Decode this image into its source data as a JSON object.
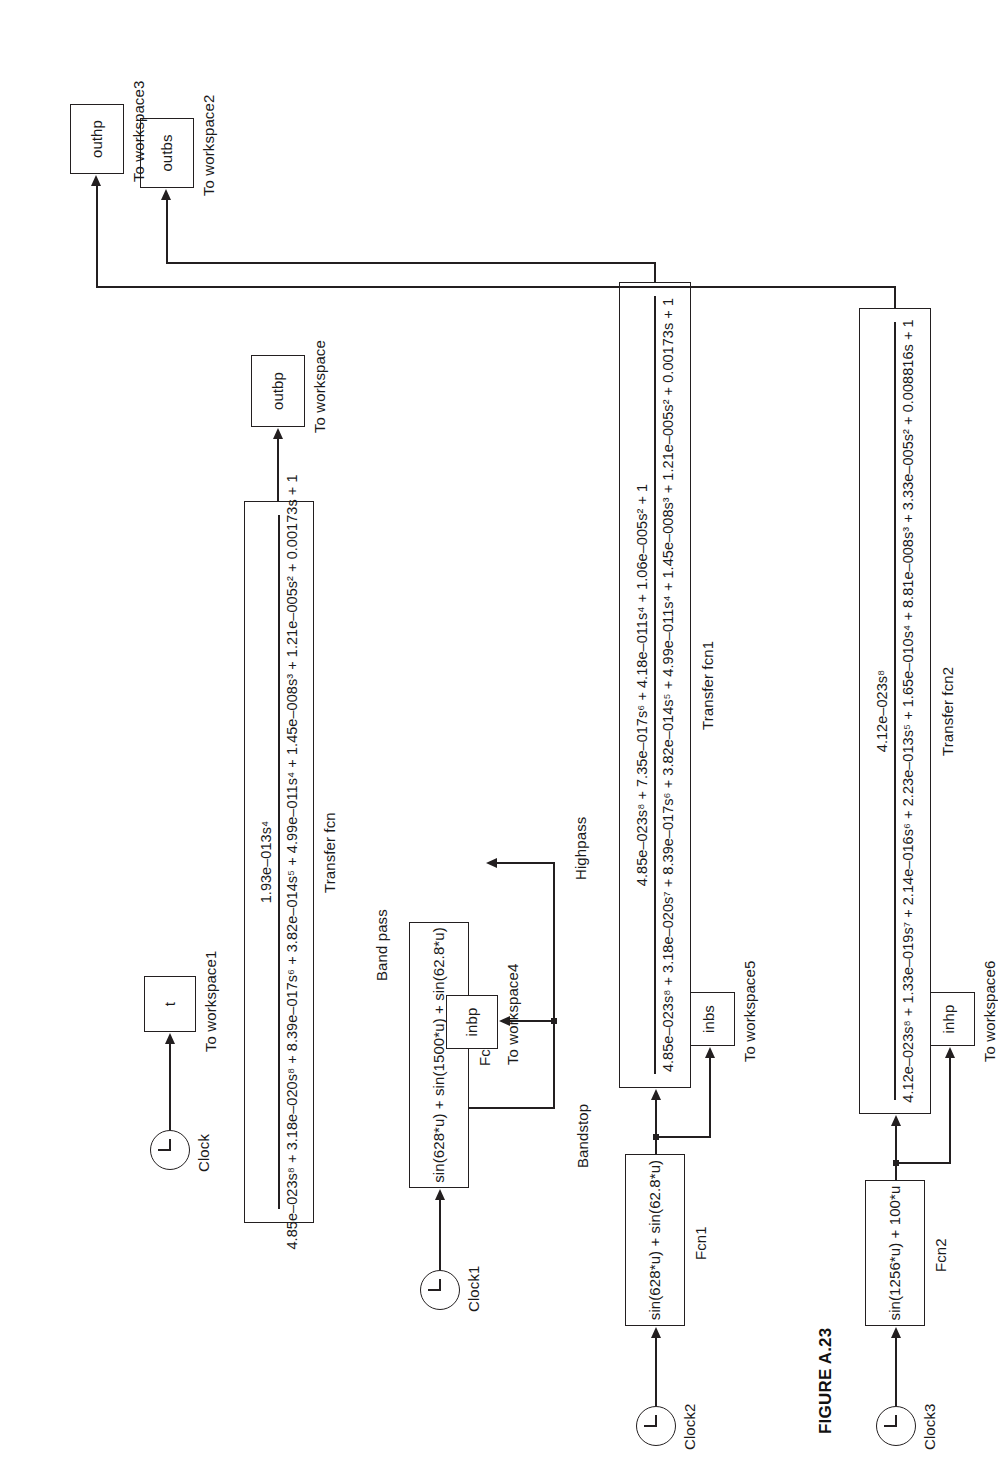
{
  "figure": {
    "caption": "FIGURE A.23"
  },
  "sources": {
    "clock": {
      "label": "Clock"
    },
    "clock1": {
      "label": "Clock1"
    },
    "clock2": {
      "label": "Clock2"
    },
    "clock3": {
      "label": "Clock3"
    }
  },
  "fcn_blocks": [
    {
      "name": "fcn",
      "expression": "sin(628*u) + sin(1500*u) + sin(62.8*u)",
      "label": "Fcn"
    },
    {
      "name": "fcn1",
      "expression": "sin(628*u) + sin(62.8*u)",
      "label": "Fcn1"
    },
    {
      "name": "fcn2",
      "expression": "sin(1256*u) + 100*u",
      "label": "Fcn2"
    }
  ],
  "filters": [
    {
      "name": "bandpass",
      "title": "Band pass",
      "numerator": "1.93e–013s⁴",
      "denominator": "4.85e–023s⁸ + 3.18e–020s⁸ + 8.39e–017s⁶ + 3.82e–014s⁵ + 4.99e–011s⁴ + 1.45e–008s³ + 1.21e–005s² + 0.00173s + 1",
      "label": "Transfer fcn"
    },
    {
      "name": "bandstop",
      "title": "Bandstop",
      "numerator": "4.85e–023s⁸ + 7.35e–017s⁶ + 4.18e–011s⁴ + 1.06e–005s² + 1",
      "denominator": "4.85e–023s⁸ + 3.18e–020s⁷ + 8.39e–017s⁶ + 3.82e–014s⁵ + 4.99e–011s⁴ + 1.45e–008s³ + 1.21e–005s² + 0.00173s + 1",
      "label": "Transfer fcn1"
    },
    {
      "name": "highpass",
      "title": "Highpass",
      "numerator": "4.12e–023s⁸",
      "denominator": "4.12e–023s⁸ + 1.33e–019s⁷ + 2.14e–016s⁶ + 2.23e–013s⁵ + 1.65e–010s⁴ + 8.81e–008s³ + 3.33e–005s² + 0.008816s + 1",
      "label": "Transfer fcn2"
    }
  ],
  "sinks": [
    {
      "name": "t",
      "value": "t",
      "label": "To workspace1"
    },
    {
      "name": "outbp",
      "value": "outbp",
      "label": "To workspace"
    },
    {
      "name": "inbp",
      "value": "inbp",
      "label": "To workspace4"
    },
    {
      "name": "outbs",
      "value": "outbs",
      "label": "To workspace2"
    },
    {
      "name": "inbs",
      "value": "inbs",
      "label": "To workspace5"
    },
    {
      "name": "outhp",
      "value": "outhp",
      "label": "To workspace3"
    },
    {
      "name": "inhp",
      "value": "inhp",
      "label": "To workspace6"
    }
  ],
  "colors": {
    "line": "#231f20",
    "background": "#ffffff"
  }
}
